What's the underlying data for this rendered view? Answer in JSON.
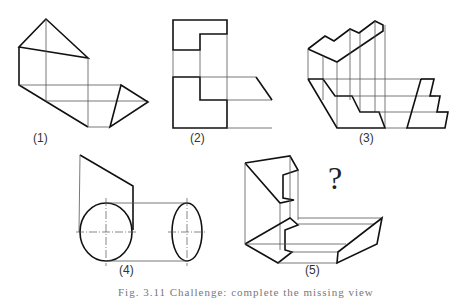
{
  "figure": {
    "labels": [
      "(1)",
      "(2)",
      "(3)",
      "(4)",
      "(5)"
    ],
    "question_mark": "?",
    "caption": "Fig. 3.11  Challenge: complete the missing view"
  },
  "colors": {
    "line": "#111111",
    "thin": "#555555",
    "background": "#ffffff"
  }
}
